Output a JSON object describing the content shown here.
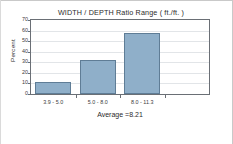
{
  "chart_data": {
    "type": "bar",
    "title": "WIDTH / DEPTH  Ratio Range ( ft./ft. )",
    "xlabel": "Average =8.21",
    "ylabel": "Percent",
    "categories": [
      "3.9 - 5.0",
      "5.0 - 8.0",
      "8.0 - 11.3",
      ""
    ],
    "values": [
      11,
      32,
      57.5,
      0
    ],
    "ylim": [
      0,
      70
    ],
    "yticks": [
      0,
      10,
      20,
      30,
      40,
      50,
      60,
      70
    ],
    "ytick_labels": [
      "0",
      "10",
      "20",
      "30",
      "40",
      "50",
      "60",
      "70"
    ],
    "grid": true,
    "legend": false,
    "bar_fill_color": "#8fafc9",
    "bar_edge_color": "#5f7d96",
    "axis_color": "#6a6f75",
    "gridline_color": "#e2e5e8"
  }
}
